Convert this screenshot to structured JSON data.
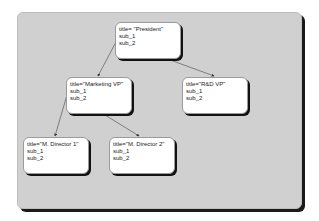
{
  "diagram": {
    "type": "tree",
    "nodes": [
      {
        "id": "president",
        "title": "title= \"President\"",
        "sub1": "sub_1",
        "sub2": "sub_2"
      },
      {
        "id": "marketing-vp",
        "title": "title=\"Marketing VP\"",
        "sub1": "sub_1",
        "sub2": "sub_2"
      },
      {
        "id": "rnd-vp",
        "title": "title=\"R&D VP\"",
        "sub1": "sub_1",
        "sub2": "sub_2"
      },
      {
        "id": "m-director-1",
        "title": "title=\"M. Director 1\"",
        "sub1": "sub_1",
        "sub2": "sub_2"
      },
      {
        "id": "m-director-2",
        "title": "title=\"M. Director 2\"",
        "sub1": "sub_1",
        "sub2": "sub_2"
      }
    ],
    "edges": [
      {
        "from": "president.sub_1",
        "to": "marketing-vp"
      },
      {
        "from": "president.sub_2",
        "to": "rnd-vp"
      },
      {
        "from": "marketing-vp.sub_1",
        "to": "m-director-1"
      },
      {
        "from": "marketing-vp.sub_2",
        "to": "m-director-2"
      }
    ]
  },
  "colors": {
    "panel": "#d0d0d0",
    "node": "#ffffff",
    "shadow": "#111111",
    "edge": "#333333"
  }
}
